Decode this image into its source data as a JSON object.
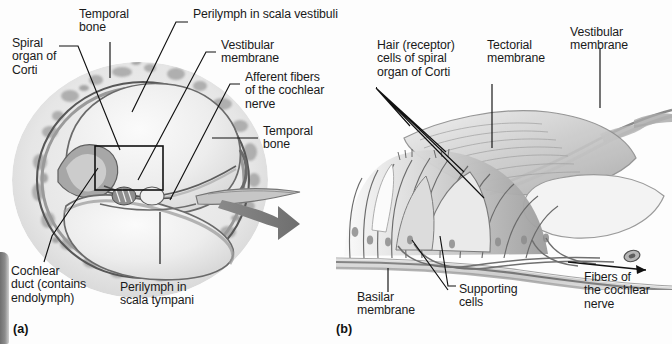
{
  "figure": {
    "background_color": "#fdfdfd",
    "ink_color": "#1a1a1a",
    "panels": [
      {
        "id": "a",
        "id_label": "(a)",
        "caption": "Cross section through one turn of the cochlea"
      },
      {
        "id": "b",
        "id_label": "(b)",
        "caption": "Magnified view of the spiral organ of Corti"
      }
    ]
  },
  "panel_a": {
    "id_label": "(a)",
    "labels": [
      {
        "key": "spiral_organ_of_corti",
        "text": "Spiral\norgan of\nCorti"
      },
      {
        "key": "temporal_bone_top",
        "text": "Temporal\nbone"
      },
      {
        "key": "perilymph_scala_vestibuli",
        "text": "Perilymph in scala vestibuli"
      },
      {
        "key": "vestibular_membrane",
        "text": "Vestibular\nmembrane"
      },
      {
        "key": "afferent_fibers",
        "text": "Afferent fibers\nof the cochlear\nnerve"
      },
      {
        "key": "temporal_bone_right",
        "text": "Temporal\nbone"
      },
      {
        "key": "cochlear_duct",
        "text": "Cochlear\nduct (contains\nendolymph)"
      },
      {
        "key": "perilymph_scala_tympani",
        "text": "Perilymph in\nscala tympani"
      }
    ]
  },
  "panel_b": {
    "id_label": "(b)",
    "labels": [
      {
        "key": "hair_cells",
        "text": "Hair (receptor)\ncells of spiral\norgan of Corti"
      },
      {
        "key": "tectorial_membrane",
        "text": "Tectorial\nmembrane"
      },
      {
        "key": "vestibular_membrane",
        "text": "Vestibular\nmembrane"
      },
      {
        "key": "basilar_membrane",
        "text": "Basilar\nmembrane"
      },
      {
        "key": "supporting_cells",
        "text": "Supporting\ncells"
      },
      {
        "key": "fibers_cochlear_nerve",
        "text": "Fibers of\nthe cochlear\nnerve"
      }
    ]
  }
}
